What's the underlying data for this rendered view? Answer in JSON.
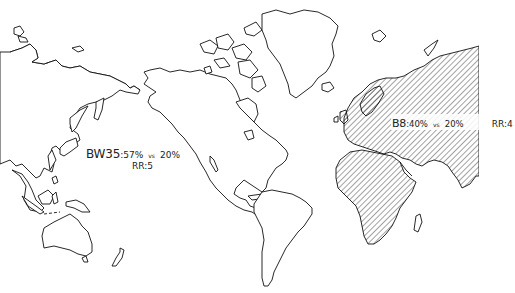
{
  "map": {
    "projection": "world outline, Pacific-left (Asia east edge on left, Europe/Africa on right)",
    "colors": {
      "background": "#ffffff",
      "outline": "#111111",
      "hatch": "#333333",
      "text": "#222222"
    },
    "hatched_regions": [
      "Europe",
      "Africa",
      "Middle East",
      "Russia/Northern Asia",
      "India"
    ],
    "annotations": [
      {
        "id": "bw35",
        "code": "BW35",
        "percent_a": ":57%",
        "vs": "vs",
        "percent_b": "20%",
        "rr": "RR:5",
        "location": "Northwest Pacific / East Asia"
      },
      {
        "id": "b8",
        "code": "B8",
        "percent_a": ":40%",
        "vs": "vs",
        "percent_b": "20%",
        "rr": "RR:4",
        "location": "Russia / Europe (hatched area)"
      }
    ]
  }
}
